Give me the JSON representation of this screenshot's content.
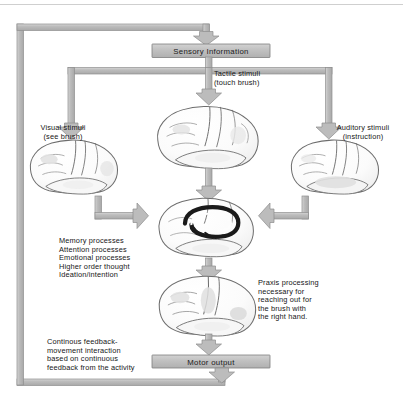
{
  "diagram": {
    "type": "flow-diagram",
    "colors": {
      "pipe_fill": "#b9b9b9",
      "pipe_stroke": "#8c8c8c",
      "box_fill": "#c2c2c2",
      "box_stroke": "#7e7e7e",
      "brain_stroke": "#6d6d6d",
      "brain_fill": "#fdfdfd",
      "brain_shade": "#e2e2e2",
      "limbic_dark": "#1a1a1a",
      "text": "#161616",
      "background": "#ffffff"
    },
    "boxes": [
      {
        "id": "sensory",
        "label": "Sensory Information"
      },
      {
        "id": "motor",
        "label": "Motor output"
      }
    ],
    "labels": {
      "tactile": "Tactile stimuli\n(touch brush)",
      "visual": "Visual stimuli\n(see brush)",
      "auditory": "Auditory stimuli\n(instruction)",
      "cognitive_processes": "Memory processes\nAttention processes\nEmotional processes\nHigher order thought\nIdeation/intention",
      "praxis": "Praxis processing\nnecessary for\nreaching out for\nthe brush with\nthe right hand.",
      "feedback": "Continous feedback-\nmovement interaction\nbased on continuous\nfeedback from the activity"
    },
    "brains": [
      {
        "id": "brain-tactile",
        "name": "lateral brain view receiving tactile input"
      },
      {
        "id": "brain-visual",
        "name": "lateral brain view receiving visual input"
      },
      {
        "id": "brain-auditory",
        "name": "lateral brain view receiving auditory input"
      },
      {
        "id": "brain-limbic",
        "name": "brain with limbic system highlighted"
      },
      {
        "id": "brain-praxis",
        "name": "brain performing praxis processing"
      }
    ],
    "flow": [
      {
        "from": "Sensory Information",
        "to": "Tactile stimuli (touch brush)"
      },
      {
        "from": "Sensory Information",
        "to": "Visual stimuli (see brush)"
      },
      {
        "from": "Sensory Information",
        "to": "Auditory stimuli (instruction)"
      },
      {
        "from": "Visual brain",
        "to": "Limbic brain"
      },
      {
        "from": "Auditory brain",
        "to": "Limbic brain"
      },
      {
        "from": "Tactile brain",
        "to": "Limbic brain"
      },
      {
        "from": "Limbic brain",
        "to": "Praxis brain"
      },
      {
        "from": "Praxis brain",
        "to": "Motor output"
      },
      {
        "from": "Motor output",
        "to": "Sensory Information"
      }
    ]
  }
}
